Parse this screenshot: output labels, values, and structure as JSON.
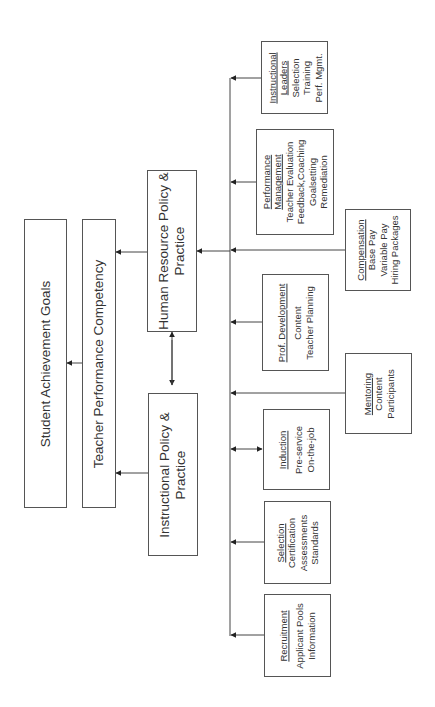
{
  "diagram": {
    "outcome": {
      "label": "Student Achievement Goals"
    },
    "competency": {
      "label": "Teacher Performance Competency"
    },
    "hr_policy": {
      "label_line1": "Human Resource Policy &",
      "label_line2": "Practice"
    },
    "instructional_policy": {
      "label_line1": "Instructional Policy &",
      "label_line2": "Practice"
    },
    "components": [
      {
        "title": "Instructional",
        "title2": "Leaders",
        "items": [
          "Selection",
          "Training",
          "Perf. Mgmt."
        ]
      },
      {
        "title": "Performance",
        "title2": "Management",
        "items": [
          "Teacher Evaluation",
          "Feedback,Coaching",
          "Goalsetting",
          "Remediation"
        ]
      },
      {
        "title": "Compensation",
        "items": [
          "Base Pay",
          "Variable Pay",
          "Hiring Packages"
        ]
      },
      {
        "title": "Prof. Development",
        "items": [
          "Content",
          "Teacher Planning"
        ]
      },
      {
        "title": "Mentoring",
        "items": [
          "Content",
          "Participants"
        ]
      },
      {
        "title": "Induction",
        "items": [
          "Pre-service",
          "On-the-job"
        ]
      },
      {
        "title": "Selection",
        "items": [
          "Certification",
          "Assessments",
          "Standards"
        ]
      },
      {
        "title": "Recruitment",
        "items": [
          "Applicant Pools",
          "Information"
        ]
      }
    ]
  }
}
